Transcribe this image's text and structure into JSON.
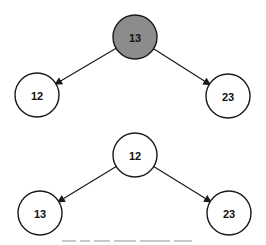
{
  "diagram": {
    "type": "binary-tree-swap",
    "colors": {
      "highlight_fill": "#8c8c8c",
      "normal_fill": "#ffffff",
      "stroke": "#1a1a1a"
    },
    "trees": [
      {
        "name": "before",
        "nodes": [
          {
            "id": "root",
            "label": "13",
            "highlighted": true,
            "cx": 135,
            "cy": 37
          },
          {
            "id": "left",
            "label": "12",
            "highlighted": false,
            "cx": 37,
            "cy": 95
          },
          {
            "id": "right",
            "label": "23",
            "highlighted": false,
            "cx": 228,
            "cy": 96
          }
        ],
        "edges": [
          {
            "from": "root",
            "to": "left"
          },
          {
            "from": "root",
            "to": "right"
          }
        ]
      },
      {
        "name": "after",
        "nodes": [
          {
            "id": "root",
            "label": "12",
            "highlighted": false,
            "cx": 135,
            "cy": 155
          },
          {
            "id": "left",
            "label": "13",
            "highlighted": false,
            "cx": 40,
            "cy": 213
          },
          {
            "id": "right",
            "label": "23",
            "highlighted": false,
            "cx": 229,
            "cy": 213
          }
        ],
        "edges": [
          {
            "from": "root",
            "to": "left"
          },
          {
            "from": "root",
            "to": "right"
          }
        ]
      }
    ],
    "node_radius": 22
  }
}
